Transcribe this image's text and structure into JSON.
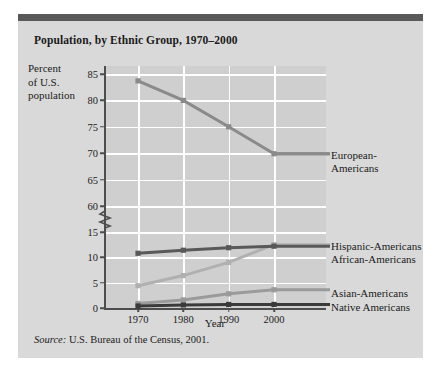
{
  "title": "Population, by Ethnic Group, 1970–2000",
  "y_axis_label": "Percent of U.S. population",
  "y_axis_label_lines": [
    "Percent",
    "of U.S.",
    "population"
  ],
  "source_prefix": "Source:",
  "source_text": " U.S. Bureau of the Census, 2001.",
  "colors": {
    "card_background": "#d9d9d9",
    "top_bar": "#595959",
    "plot_background": "#cfcfcf",
    "gridline": "#ffffff",
    "axis": "#4d4d4d",
    "european": "#8a8a8a",
    "african": "#595959",
    "hispanic": "#b0b0b0",
    "asian": "#9a9a9a",
    "native": "#3a3a3a",
    "text": "#1b1b1b"
  },
  "labels": {
    "european_line1": "European-",
    "european_line2": "Americans",
    "hispanic": "Hispanic-Americans",
    "african": "African-Americans",
    "asian": "Asian-Americans",
    "native": "Native Americans"
  },
  "chart_data": {
    "type": "line",
    "title": "Population, by Ethnic Group, 1970–2000",
    "xlabel": "Year",
    "ylabel": "Percent of U.S. population",
    "x": [
      1970,
      1980,
      1990,
      2000
    ],
    "xtick_labels": [
      "1970",
      "1980",
      "1990",
      "2000"
    ],
    "ytick_labels": [
      "0",
      "5",
      "10",
      "15",
      "60",
      "65",
      "70",
      "75",
      "80",
      "85"
    ],
    "yticks_lower": [
      0,
      5,
      10,
      15
    ],
    "yticks_upper": [
      60,
      65,
      70,
      75,
      80,
      85
    ],
    "axis_break": true,
    "axis_break_between": [
      15,
      60
    ],
    "grid": true,
    "legend_position": "right-inline",
    "series": [
      {
        "name": "European-Americans",
        "values": [
          83.7,
          80.0,
          75.0,
          69.9
        ],
        "color": "#8a8a8a"
      },
      {
        "name": "Hispanic-Americans",
        "values": [
          4.4,
          6.4,
          9.0,
          12.5
        ],
        "color": "#b0b0b0"
      },
      {
        "name": "African-Americans",
        "values": [
          10.8,
          11.4,
          11.9,
          12.2
        ],
        "color": "#595959"
      },
      {
        "name": "Asian-Americans",
        "values": [
          0.9,
          1.6,
          2.8,
          3.6
        ],
        "color": "#9a9a9a"
      },
      {
        "name": "Native Americans",
        "values": [
          0.4,
          0.6,
          0.7,
          0.7
        ],
        "color": "#3a3a3a"
      }
    ]
  },
  "source_full": "Source: U.S. Bureau of the Census, 2001."
}
